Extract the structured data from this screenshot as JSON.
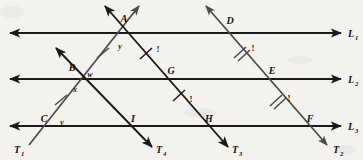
{
  "figure": {
    "background_color": "#f4f2ee",
    "ink_color": "#1a1a1a",
    "parallel_lines": [
      {
        "name": "L1",
        "label": "L",
        "subscript": "1",
        "y": 33
      },
      {
        "name": "L2",
        "label": "L",
        "subscript": "2",
        "y": 79
      },
      {
        "name": "L3",
        "label": "L",
        "subscript": "3",
        "y": 126
      }
    ],
    "transversals": [
      {
        "name": "T1",
        "label": "T",
        "subscript": "1",
        "direction": "up-right"
      },
      {
        "name": "T2",
        "label": "T",
        "subscript": "2",
        "direction": "down-right"
      },
      {
        "name": "T3",
        "label": "T",
        "subscript": "3",
        "direction": "down-right"
      },
      {
        "name": "T4",
        "label": "T",
        "subscript": "4",
        "direction": "down-right"
      }
    ],
    "points": [
      {
        "name": "A",
        "label": "A",
        "x": 122,
        "y": 20
      },
      {
        "name": "B",
        "label": "B",
        "x": 74,
        "y": 68
      },
      {
        "name": "C",
        "label": "C",
        "x": 44,
        "y": 119
      },
      {
        "name": "D",
        "label": "D",
        "x": 228,
        "y": 21
      },
      {
        "name": "E",
        "label": "E",
        "x": 272,
        "y": 71
      },
      {
        "name": "F",
        "label": "F",
        "x": 310,
        "y": 119
      },
      {
        "name": "G",
        "label": "G",
        "x": 170,
        "y": 70
      },
      {
        "name": "H",
        "label": "H",
        "x": 208,
        "y": 119
      },
      {
        "name": "I",
        "label": "I",
        "x": 130,
        "y": 119
      }
    ],
    "angles": [
      {
        "name": "w",
        "label": "w",
        "x": 90,
        "y": 76
      },
      {
        "name": "x",
        "label": "x",
        "x": 76,
        "y": 93
      },
      {
        "name": "y",
        "label": "y",
        "x": 119,
        "y": 48
      },
      {
        "name": "v",
        "label": "v",
        "x": 61,
        "y": 124
      }
    ],
    "tick_labels": [
      {
        "name": "tick-label-ay",
        "label": "!",
        "x": 158,
        "y": 50
      },
      {
        "name": "tick-label-de",
        "label": "!",
        "x": 252,
        "y": 50
      },
      {
        "name": "tick-label-gh",
        "label": "!",
        "x": 190,
        "y": 100
      },
      {
        "name": "tick-label-ef",
        "label": "!",
        "x": 288,
        "y": 100
      }
    ],
    "tick_marks": [
      {
        "name": "tick-CB",
        "count": 1,
        "segment": "C-B"
      },
      {
        "name": "tick-BA",
        "count": 1,
        "segment": "B-A"
      },
      {
        "name": "tick-AG",
        "count": 1,
        "segment": "A-G"
      },
      {
        "name": "tick-GH",
        "count": 1,
        "segment": "G-H"
      },
      {
        "name": "tick-DE",
        "count": 2,
        "segment": "D-E"
      },
      {
        "name": "tick-EF",
        "count": 2,
        "segment": "E-F"
      }
    ]
  }
}
